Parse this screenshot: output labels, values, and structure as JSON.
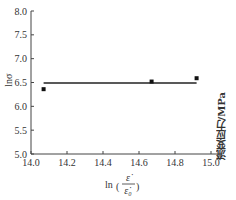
{
  "chart_data": {
    "type": "scatter",
    "title": "",
    "xlabel": "ln(ε̇/ε̇0)",
    "ylabel": "lnσ",
    "right_label": "流变应力/MPa",
    "xlim": [
      14.0,
      15.07
    ],
    "ylim": [
      5.0,
      8.0
    ],
    "x_ticks": [
      "14.0",
      "14.2",
      "14.4",
      "14.6",
      "14.8",
      "15.0"
    ],
    "y_ticks": [
      "5.0",
      "5.5",
      "6.0",
      "6.5",
      "7.0",
      "7.5",
      "8.0"
    ],
    "grid": false,
    "legend": null,
    "series": [
      {
        "name": "experimental points",
        "marker": "square",
        "x": [
          14.07,
          14.67,
          14.92
        ],
        "y": [
          6.36,
          6.52,
          6.59
        ]
      },
      {
        "name": "fit line",
        "type": "line",
        "x": [
          14.07,
          14.92
        ],
        "y": [
          6.49,
          6.49
        ]
      }
    ]
  },
  "labels": {
    "xlabel_prefix": "ln",
    "xlabel_num": "ε̇",
    "xlabel_den": "ε̇₀",
    "ylabel": "lnσ",
    "right_label": "流变应力/MPa"
  }
}
